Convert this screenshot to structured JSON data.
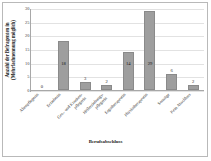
{
  "chart_data": {
    "type": "bar",
    "title": "",
    "xlabel": "Berufsabschluss",
    "ylabel_lines": [
      "Anzahl der Befragenten in",
      "(Mehrfachnennung möglich)"
    ],
    "categories": [
      "Altenpflegerin",
      "Erzieherin",
      "Gesundheits- und Krankenpflegerin",
      "Heilerziehungspflegerin",
      "Ergotherapeutin",
      "Physiotherapeutin",
      "Sonstige",
      "Kein Abschluss"
    ],
    "category_lines": [
      [
        "Altenpflegerin"
      ],
      [
        "Erzieherin"
      ],
      [
        "Ges.- und Kranken-",
        "pflegerin"
      ],
      [
        "Heilerziehungs-",
        "pflegerin"
      ],
      [
        "Ergotherapeutin"
      ],
      [
        "Physiotherapeutin"
      ],
      [
        "Sonstige"
      ],
      [
        "Kein Abschluss"
      ]
    ],
    "values": [
      0,
      18,
      3,
      2,
      14,
      29,
      6,
      2
    ],
    "value_labels": [
      "0",
      "18",
      "3",
      "2",
      "14",
      "29",
      "6",
      "2"
    ],
    "ylim": [
      0,
      30
    ],
    "yticks": [
      0,
      5,
      10,
      15,
      20,
      25,
      30
    ],
    "ytick_labels": [
      "0",
      "5",
      "10",
      "15",
      "20",
      "25",
      "30"
    ],
    "grid": true,
    "legend": "none",
    "bar_color": "#9e9e9e",
    "bar_border_color": "#8a8a8a",
    "axis_color": "#a8a8a8",
    "grid_color": "#e2e2e2",
    "text_color": "#1d1d1d"
  }
}
